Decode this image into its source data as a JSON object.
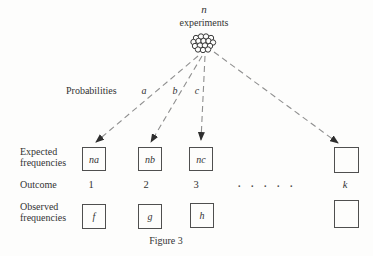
{
  "header": {
    "count_symbol": "n",
    "label": "experiments"
  },
  "probabilities": {
    "label": "Probabilities",
    "values": [
      "a",
      "b",
      "c"
    ]
  },
  "expected_row": {
    "label_lines": [
      "Expected",
      "frequencies"
    ],
    "boxes": [
      "na",
      "nb",
      "nc",
      ""
    ]
  },
  "outcome_row": {
    "label": "Outcome",
    "values": [
      "1",
      "2",
      "3",
      ". . . . .",
      "k"
    ]
  },
  "observed_row": {
    "label_lines": [
      "Observed",
      "frequencies"
    ],
    "boxes": [
      "f",
      "g",
      "h",
      ""
    ]
  },
  "caption": "Figure 3",
  "icons": {
    "cluster": "experiments-cluster-icon"
  },
  "colors": {
    "background": "#fdfdfc",
    "text": "#333333",
    "dashed_line": "#8f8f8f",
    "arrowhead": "#2e2e2e",
    "box_border": "#4f4f4f"
  }
}
